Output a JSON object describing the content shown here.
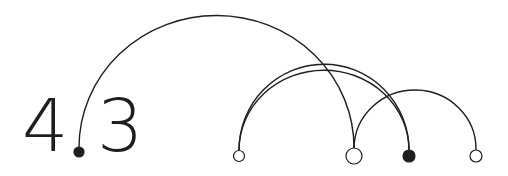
{
  "logo": {
    "left_digit": "4",
    "right_digit": "3",
    "text": "4.3",
    "ink_color": "#1e1e1e",
    "background": "#ffffff"
  },
  "diagram": {
    "nodes": [
      {
        "id": "decimal-point",
        "x": 79,
        "y": 152,
        "r": 5,
        "filled": true
      },
      {
        "id": "node-1",
        "x": 239,
        "y": 156,
        "r": 5.5,
        "filled": false
      },
      {
        "id": "node-2",
        "x": 354,
        "y": 156,
        "r": 8,
        "filled": false
      },
      {
        "id": "node-3",
        "x": 409,
        "y": 156,
        "r": 6,
        "filled": true
      },
      {
        "id": "node-4",
        "x": 476,
        "y": 156,
        "r": 6,
        "filled": false
      }
    ],
    "arcs": [
      {
        "from": "decimal-point",
        "to": "node-2",
        "peak_y": 15
      },
      {
        "from": "node-1",
        "to": "node-3",
        "peak_y": 64
      },
      {
        "from": "node-1",
        "to": "node-3",
        "peak_y": 70
      },
      {
        "from": "node-2",
        "to": "node-4",
        "peak_y": 89
      }
    ]
  }
}
